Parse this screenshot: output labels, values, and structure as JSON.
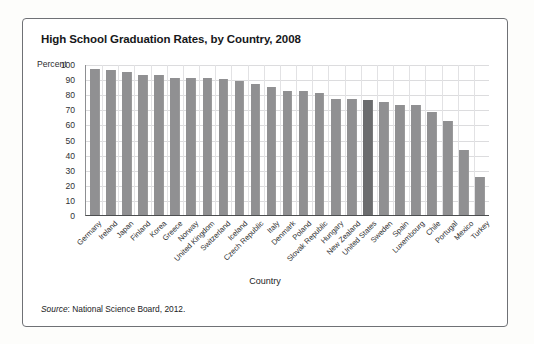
{
  "figure": {
    "title": "High School Graduation Rates, by Country, 2008",
    "source_label": "Source",
    "source_separator": ": ",
    "source_text": "National Science Board, 2012."
  },
  "colors": {
    "bar": "#909092",
    "bar_highlight": "#6b6c6e",
    "frame": "#6f7175",
    "grid": "#dcdcde",
    "axis": "#4c4e50",
    "text": "#17181a",
    "background": "#ffffff"
  },
  "chart_data": {
    "type": "bar",
    "title": "High School Graduation Rates, by Country, 2008",
    "subtitle": "",
    "xlabel": "Country",
    "ylabel": "Percent",
    "ylim": [
      0,
      100
    ],
    "ytick_step": 10,
    "ytick_labels": [
      "100",
      "90",
      "80",
      "70",
      "60",
      "50",
      "40",
      "30",
      "20",
      "10",
      "0"
    ],
    "ytick_values": [
      100,
      90,
      80,
      70,
      60,
      50,
      40,
      30,
      20,
      10,
      0
    ],
    "grid": true,
    "grid_axis": "both",
    "legend": false,
    "legend_position": "none",
    "highlight_category": "United States",
    "categories": [
      "Germany",
      "Ireland",
      "Japan",
      "Finland",
      "Korea",
      "Greece",
      "Norway",
      "United Kingdom",
      "Switzerland",
      "Iceland",
      "Czech Republic",
      "Italy",
      "Denmark",
      "Poland",
      "Slovak Republic",
      "Hungary",
      "New Zealand",
      "United States",
      "Sweden",
      "Spain",
      "Luxembourg",
      "Chile",
      "Portugal",
      "Mexico",
      "Turkey"
    ],
    "values": [
      97,
      96,
      95,
      93,
      93,
      91,
      91,
      91,
      90,
      89,
      87,
      85,
      82,
      82,
      81,
      77,
      77,
      76,
      75,
      73,
      73,
      68,
      62,
      43,
      25
    ]
  }
}
